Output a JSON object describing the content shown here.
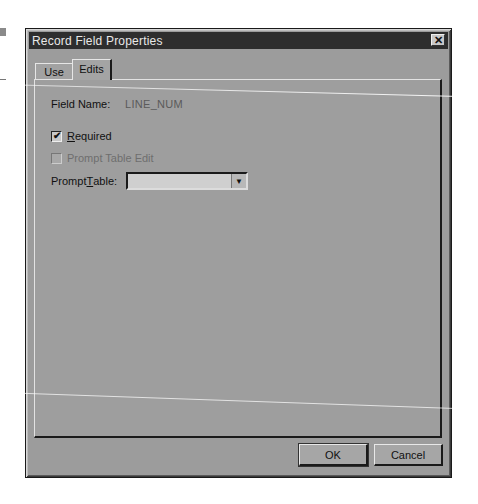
{
  "window": {
    "title": "Record Field Properties",
    "close_icon": "close-x-icon"
  },
  "tabs": [
    {
      "label": "Use",
      "active": false
    },
    {
      "label": "Edits",
      "active": true
    }
  ],
  "edits": {
    "field_name_label": "Field Name:",
    "field_name_value": "LINE_NUM",
    "required": {
      "label": "Required",
      "mnemonic": "R",
      "rest": "equired",
      "checked": true
    },
    "prompt_table_edit": {
      "label": "Prompt Table Edit",
      "checked": false,
      "disabled": true
    },
    "prompt_table": {
      "label_pre": "Prompt ",
      "mnemonic": "T",
      "label_post": "able:",
      "value": "",
      "dropdown_icon": "dropdown-arrow-icon"
    }
  },
  "buttons": {
    "ok_label": "OK",
    "cancel_label": "Cancel"
  },
  "icons": {
    "check": "✔",
    "close": "✕",
    "arrow": "▼"
  }
}
